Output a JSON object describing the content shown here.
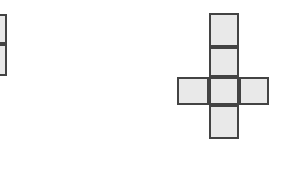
{
  "canvas": {
    "width": 302,
    "height": 186,
    "background": "#ffffff"
  },
  "style": {
    "cell_fill": "#e9e9e9",
    "cell_stroke": "#434343",
    "stroke_width": 2
  },
  "diagram": {
    "type": "geometric-net",
    "shapes": [
      {
        "name": "left-partial-column",
        "label": "",
        "clipped": true,
        "clipped_edge": "left",
        "visible_cell_count": 2,
        "arrangement": "vertical column of 2 squares, left portion cut off by image edge",
        "cells": [
          {
            "name": "left-cell-top",
            "x": -23,
            "y": 14,
            "w": 30,
            "h": 30
          },
          {
            "name": "left-cell-bottom",
            "x": -23,
            "y": 44,
            "w": 30,
            "h": 32
          }
        ]
      },
      {
        "name": "right-cross-net",
        "label": "",
        "clipped": false,
        "visible_cell_count": 6,
        "arrangement": "plus/cross shaped net: vertical column of 4 squares with one square on each side of the third row",
        "cells": [
          {
            "name": "cross-cell-column-1",
            "x": 209,
            "y": 13,
            "w": 30,
            "h": 34
          },
          {
            "name": "cross-cell-column-2",
            "x": 209,
            "y": 47,
            "w": 30,
            "h": 30
          },
          {
            "name": "cross-cell-left",
            "x": 177,
            "y": 77,
            "w": 32,
            "h": 28
          },
          {
            "name": "cross-cell-center",
            "x": 209,
            "y": 77,
            "w": 30,
            "h": 28
          },
          {
            "name": "cross-cell-right",
            "x": 239,
            "y": 77,
            "w": 30,
            "h": 28
          },
          {
            "name": "cross-cell-bottom",
            "x": 209,
            "y": 105,
            "w": 30,
            "h": 34
          }
        ]
      }
    ]
  }
}
